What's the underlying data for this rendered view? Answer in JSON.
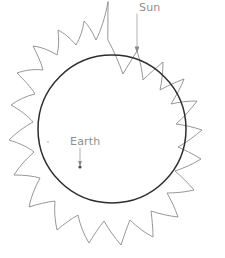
{
  "diagram": {
    "type": "hand-drawn astronomy sketch",
    "background_color": "#ffffff",
    "canvas": {
      "width": 225,
      "height": 258
    },
    "sun": {
      "label": "Sun",
      "label_position": {
        "x": 139,
        "y": 10
      },
      "disc": {
        "center_x": 112,
        "center_y": 129,
        "radius": 74,
        "stroke_color": "#2e2e2e",
        "fill": "none"
      },
      "rays": {
        "stroke_color": "#8b8b8b",
        "count": 16,
        "style": "curved spiky corona"
      },
      "leader": {
        "from_x": 137,
        "from_y": 14,
        "to_x": 137,
        "to_y": 51,
        "color": "#a8a8a8",
        "has_arrowhead": true
      }
    },
    "earth": {
      "label": "Earth",
      "label_position": {
        "x": 70,
        "y": 144
      },
      "marker": {
        "x": 80,
        "y": 167,
        "radius": 1.6,
        "color": "#4a4a4a"
      },
      "leader": {
        "from_x": 80,
        "from_y": 148,
        "to_x": 80,
        "to_y": 165,
        "color": "#a8a8a8",
        "has_arrowhead": true
      }
    },
    "speck": {
      "x": 48,
      "y": 142,
      "radius": 1.0,
      "color": "#cdcdcd"
    }
  }
}
